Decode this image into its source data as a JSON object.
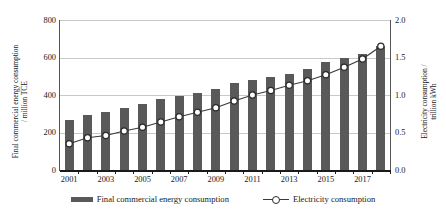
{
  "axes": {
    "left_title_line1": "Final commercial energy consumption",
    "left_title_line2": "/ million TCE",
    "right_title_line1": "Electricity consumption /",
    "right_title_line2": "trillion kWh",
    "left_ticks": [
      "800",
      "600",
      "400",
      "200",
      "0"
    ],
    "right_ticks": [
      "2.0",
      "1.5",
      "1.0",
      "0.5",
      "0.0"
    ],
    "x_ticks": [
      "2001",
      "2003",
      "2005",
      "2007",
      "2009",
      "2011",
      "2013",
      "2015",
      "2017"
    ]
  },
  "legend": {
    "bar_label": "Final commercial energy consumption",
    "line_label": "Electricity consumption"
  },
  "colors": {
    "bar": "#595959",
    "line": "#3a3a3a",
    "marker_face": "#ffffff",
    "marker_edge": "#2b2b2b",
    "grid": "#c9c9c9",
    "axis": "#1a1a1a"
  },
  "chart_data": {
    "type": "bar",
    "title": "",
    "xlabel": "",
    "ylabel": "Final commercial energy consumption / million TCE",
    "y2label": "Electricity consumption / trillion kWh",
    "ylim": [
      0,
      800
    ],
    "y2lim": [
      0.0,
      2.0
    ],
    "grid": true,
    "legend_position": "bottom",
    "categories": [
      "2001",
      "2002",
      "2003",
      "2004",
      "2005",
      "2006",
      "2007",
      "2008",
      "2009",
      "2010",
      "2011",
      "2012",
      "2013",
      "2014",
      "2015",
      "2016",
      "2017",
      "2018"
    ],
    "series": [
      {
        "name": "Final commercial energy consumption",
        "type": "bar",
        "axis": "left",
        "unit": "million TCE",
        "values": [
          265,
          295,
          310,
          330,
          350,
          378,
          395,
          410,
          432,
          462,
          478,
          497,
          512,
          540,
          578,
          600,
          620,
          660
        ]
      },
      {
        "name": "Electricity consumption",
        "type": "line",
        "axis": "right",
        "unit": "trillion kWh",
        "marker": "open-circle",
        "values": [
          0.35,
          0.43,
          0.46,
          0.52,
          0.57,
          0.64,
          0.71,
          0.77,
          0.83,
          0.92,
          1.0,
          1.06,
          1.13,
          1.19,
          1.27,
          1.37,
          1.48,
          1.65
        ]
      }
    ]
  }
}
